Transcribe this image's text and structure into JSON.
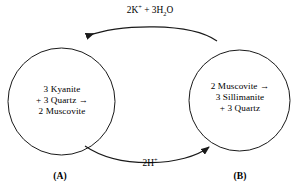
{
  "diagram": {
    "type": "cycle",
    "background_color": "#ffffff",
    "stroke_color": "#1a1a1a",
    "nodes": [
      {
        "id": "A",
        "caption": "(A)",
        "shape": "circle",
        "lines": [
          "3 Kyanite",
          "+ 3 Quartz →",
          "2 Muscovite"
        ]
      },
      {
        "id": "B",
        "caption": "(B)",
        "shape": "circle",
        "lines": [
          "2 Muscovite →",
          "3 Sillimanite",
          "+ 3 Quartz"
        ]
      }
    ],
    "edges": [
      {
        "id": "top-edge",
        "from": "B",
        "to": "A",
        "direction": "right-to-left",
        "label_plain": "2K+ + 3H2O",
        "label_parts": {
          "a": "2K",
          "a_sup": "+",
          "b": " + 3H",
          "b_sub": "2",
          "c": "O"
        }
      },
      {
        "id": "bottom-edge",
        "from": "A",
        "to": "B",
        "direction": "left-to-right",
        "label_plain": "2H+",
        "label_parts": {
          "a": "2H",
          "a_sup": "+"
        }
      }
    ]
  }
}
